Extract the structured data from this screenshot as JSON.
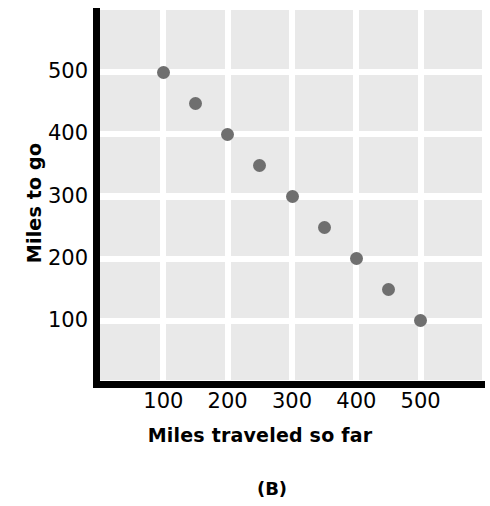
{
  "chart_data": {
    "type": "scatter",
    "title": "",
    "caption": "(B)",
    "xlabel": "Miles traveled so far",
    "ylabel": "Miles to go",
    "xlim": [
      0,
      600
    ],
    "ylim": [
      0,
      600
    ],
    "xticks": [
      "100",
      "200",
      "300",
      "400",
      "500"
    ],
    "xtick_values": [
      100,
      200,
      300,
      400,
      500
    ],
    "yticks": [
      "500",
      "400",
      "300",
      "200",
      "100"
    ],
    "ytick_values": [
      500,
      400,
      300,
      200,
      100
    ],
    "grid": true,
    "legend": "none",
    "x": [
      100,
      150,
      200,
      250,
      300,
      350,
      400,
      450,
      500
    ],
    "y": [
      500,
      450,
      400,
      350,
      300,
      250,
      200,
      150,
      100
    ],
    "points": [
      {
        "x": 100,
        "y": 500
      },
      {
        "x": 150,
        "y": 450
      },
      {
        "x": 200,
        "y": 400
      },
      {
        "x": 250,
        "y": 350
      },
      {
        "x": 300,
        "y": 300
      },
      {
        "x": 350,
        "y": 250
      },
      {
        "x": 400,
        "y": 200
      },
      {
        "x": 450,
        "y": 150
      },
      {
        "x": 500,
        "y": 100
      }
    ],
    "marker_color": "#6f6f6f",
    "plot_background": "#e9e9e9",
    "gridline_color": "#ffffff",
    "axis_color": "#000000"
  }
}
